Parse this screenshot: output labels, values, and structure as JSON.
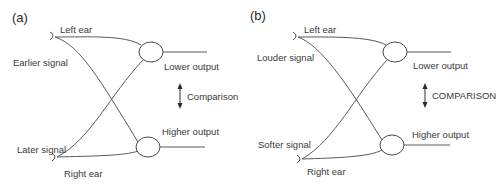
{
  "panels": [
    {
      "id": "a",
      "label": "(a)",
      "top_ear_label": "Left ear",
      "bottom_ear_label": "Right ear",
      "top_signal_label": "Earlier signal",
      "bottom_signal_label": "Later signal",
      "top_output_label": "Lower output",
      "bottom_output_label": "Higher output",
      "comparison_label": "Comparison"
    },
    {
      "id": "b",
      "label": "(b)",
      "top_ear_label": "Left ear",
      "bottom_ear_label": "Right ear",
      "top_signal_label": "Louder signal",
      "bottom_signal_label": "Softer signal",
      "top_output_label": "Lower output",
      "bottom_output_label": "Higher output",
      "comparison_label": "COMPARISON"
    }
  ],
  "colors": {
    "line": "#5a5a5a",
    "text": "#3a3a3a",
    "background": "#ffffff"
  }
}
